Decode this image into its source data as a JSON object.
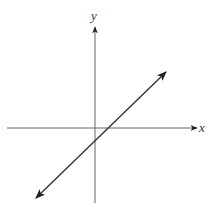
{
  "diagram": {
    "type": "coordinate-plane-line",
    "axes": {
      "x_label": "x",
      "y_label": "y",
      "origin_px": [
        95,
        128
      ],
      "x_axis": {
        "start": [
          7,
          128
        ],
        "end": [
          197,
          128
        ]
      },
      "y_axis": {
        "start": [
          95,
          203
        ],
        "end": [
          95,
          27
        ]
      }
    },
    "line": {
      "description": "Line with positive slope, arrows at both ends; crosses x-axis right of origin (positive x-intercept) and y-axis below origin (negative y-intercept)",
      "start": [
        36,
        198
      ],
      "end": [
        166,
        72
      ],
      "x_intercept_sign": "positive",
      "y_intercept_sign": "negative",
      "slope_sign": "positive"
    },
    "colors": {
      "axis": "#555555",
      "line": "#333333",
      "background": "#ffffff"
    }
  }
}
